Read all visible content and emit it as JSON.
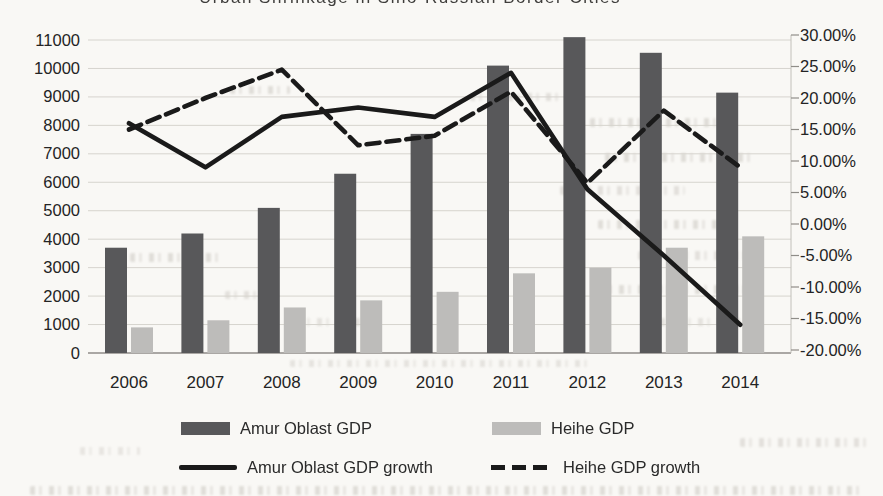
{
  "page": {
    "top_cropped_line": "Urban Shrinkage in Sino-Russian Border Cities"
  },
  "chart_data": {
    "type": "bar",
    "subtype": "clustered-bar-with-lines-combo",
    "title": "",
    "categories": [
      "2006",
      "2007",
      "2008",
      "2009",
      "2010",
      "2011",
      "2012",
      "2013",
      "2014"
    ],
    "series": [
      {
        "name": "Amur Oblast GDP",
        "type": "bar",
        "axis": "left",
        "color": "#58585a",
        "values": [
          3700,
          4200,
          5100,
          6300,
          7700,
          10100,
          11100,
          10550,
          9150
        ]
      },
      {
        "name": "Heihe GDP",
        "type": "bar",
        "axis": "left",
        "color": "#bdbcba",
        "values": [
          900,
          1150,
          1600,
          1850,
          2150,
          2800,
          3000,
          3700,
          4100
        ]
      },
      {
        "name": "Amur Oblast GDP growth",
        "type": "line",
        "style": "solid",
        "axis": "right",
        "color": "#1a1a1a",
        "values": [
          16,
          9,
          17,
          18.5,
          17,
          24,
          5.5,
          -5,
          -16
        ]
      },
      {
        "name": "Heihe GDP growth",
        "type": "line",
        "style": "dashed",
        "axis": "right",
        "color": "#1a1a1a",
        "values": [
          15,
          20,
          24.5,
          12.5,
          14,
          21,
          6.5,
          18,
          9
        ]
      }
    ],
    "left_axis": {
      "min": 0,
      "max": 11000,
      "step": 1000,
      "tick_values": [
        11000,
        10000,
        9000,
        8000,
        7000,
        6000,
        5000,
        4000,
        3000,
        2000,
        1000,
        0
      ],
      "tick_labels": [
        "11000",
        "10000",
        "9000",
        "8000",
        "7000",
        "6000",
        "5000",
        "4000",
        "3000",
        "2000",
        "1000",
        "0"
      ]
    },
    "right_axis": {
      "min": -20,
      "max": 30,
      "step": 5,
      "tick_values": [
        30,
        25,
        20,
        15,
        10,
        5,
        0,
        -5,
        -10,
        -15,
        -20
      ],
      "tick_labels": [
        "30.00%",
        "25.00%",
        "20.00%",
        "15.00%",
        "10.00%",
        "5.00%",
        "0.00%",
        "-5.00%",
        "-10.00%",
        "-15.00%",
        "-20.00%"
      ]
    },
    "grid": true,
    "legend_position": "bottom"
  }
}
